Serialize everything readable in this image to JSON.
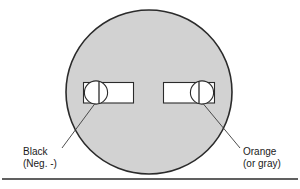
{
  "figure": {
    "name": "battery-terminal-polarity-diagram",
    "colors": {
      "body_fill": "#d2d2d2",
      "outline": "#2b2b2b",
      "terminal_fill": "#ffffff",
      "leader_line": "#3a3a3a",
      "rule": "#2b2b2b",
      "text": "#1a1a1a"
    },
    "body": {
      "shape": "circle",
      "center_x": 149,
      "center_y": 92,
      "radius_x": 83,
      "radius_y": 82
    },
    "terminals": [
      {
        "id": "left-terminal",
        "polarity": "negative",
        "rect": {
          "x": 83,
          "y": 82,
          "width": 51,
          "height": 21
        },
        "circle": {
          "cx": 96,
          "cy": 92,
          "r": 12
        },
        "divider_x": 99
      },
      {
        "id": "right-terminal",
        "polarity": "positive",
        "rect": {
          "x": 163,
          "y": 82,
          "width": 52,
          "height": 21
        },
        "circle": {
          "cx": 202,
          "cy": 92,
          "r": 12
        },
        "divider_x": 199
      }
    ],
    "leaders": [
      {
        "id": "left-leader",
        "x1": 95,
        "y1": 103,
        "x2": 62,
        "y2": 148
      },
      {
        "id": "right-leader",
        "x1": 202,
        "y1": 103,
        "x2": 240,
        "y2": 148
      }
    ],
    "rule": {
      "x1": 2,
      "y1": 179,
      "x2": 298,
      "y2": 179
    }
  },
  "labels": {
    "black": {
      "line1": "Black",
      "line2": "(Neg. -)"
    },
    "orange": {
      "line1": "Orange",
      "line2": "(or gray)"
    }
  }
}
